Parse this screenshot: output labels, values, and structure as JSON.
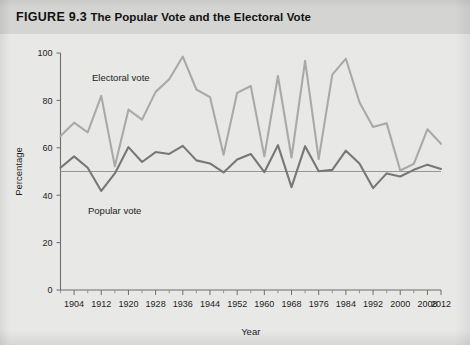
{
  "figure": {
    "number": "FIGURE 9.3",
    "title": "The Popular Vote and the Electoral Vote"
  },
  "chart_data": {
    "type": "line",
    "title": "The Popular Vote and the Electoral Vote",
    "xlabel": "Year",
    "ylabel": "Percentage",
    "xlim": [
      1900,
      2012
    ],
    "ylim": [
      0,
      100
    ],
    "yticks": [
      0,
      20,
      40,
      60,
      80,
      100
    ],
    "xticks": [
      1904,
      1912,
      1920,
      1928,
      1936,
      1944,
      1952,
      1960,
      1968,
      1976,
      1984,
      1992,
      2000,
      2008,
      2012
    ],
    "xtick_labels": [
      "1904",
      "1912",
      "1920",
      "1928",
      "1936",
      "1944",
      "1952",
      "1960",
      "1968",
      "1976",
      "1984",
      "1992",
      "2000",
      "2008",
      "2012"
    ],
    "minor_tick_interval": 4,
    "grid": false,
    "legend": "inline-annotation",
    "reference_line": {
      "y": 50,
      "label": "50 percent"
    },
    "x": [
      1900,
      1904,
      1908,
      1912,
      1916,
      1920,
      1924,
      1928,
      1932,
      1936,
      1940,
      1944,
      1948,
      1952,
      1956,
      1960,
      1964,
      1968,
      1972,
      1976,
      1980,
      1984,
      1988,
      1992,
      1996,
      2000,
      2004,
      2008,
      2012
    ],
    "series": [
      {
        "name": "Electoral vote",
        "color": "#a9a9a7",
        "annotation": "Electoral vote",
        "values": [
          65,
          70.6,
          66.5,
          81.9,
          52.2,
          76.1,
          71.9,
          83.6,
          88.9,
          98.5,
          84.6,
          81.4,
          57.1,
          83.2,
          86.1,
          56.4,
          90.3,
          55.9,
          96.7,
          55.2,
          90.9,
          97.6,
          79.2,
          68.8,
          70.4,
          50.4,
          53.2,
          67.8,
          61.7
        ]
      },
      {
        "name": "Popular vote",
        "color": "#77777a",
        "annotation": "Popular vote",
        "values": [
          51.6,
          56.4,
          51.6,
          41.8,
          49.2,
          60.3,
          54.0,
          58.2,
          57.4,
          60.8,
          54.7,
          53.4,
          49.6,
          55.1,
          57.4,
          49.7,
          61.1,
          43.4,
          60.7,
          50.1,
          50.7,
          58.8,
          53.4,
          43.0,
          49.2,
          47.9,
          50.7,
          52.9,
          51.1
        ]
      }
    ]
  },
  "annotations": {
    "electoral_label": "Electoral vote",
    "popular_label": "Popular vote"
  }
}
